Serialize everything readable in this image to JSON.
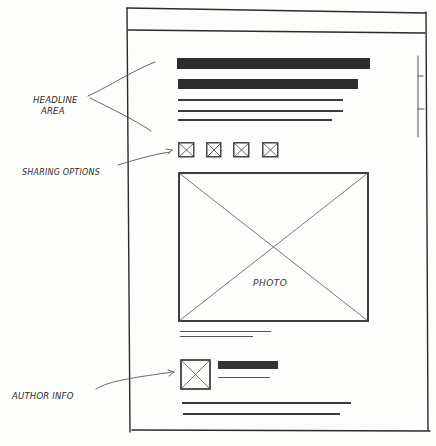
{
  "annotations": {
    "headline_area": [
      "HEADLINE",
      "AREA"
    ],
    "sharing_options": "SHARING OPTIONS",
    "author_info": "AUTHOR INFO"
  },
  "wireframe": {
    "browser_frame": {
      "has_top_bar": true,
      "has_scrollbar": true
    },
    "headline_bars": 2,
    "summary_lines": 3,
    "sharing_icons": [
      {
        "name": "share-icon-1"
      },
      {
        "name": "share-icon-2"
      },
      {
        "name": "share-icon-3"
      },
      {
        "name": "share-icon-4"
      }
    ],
    "photo": {
      "label": "PHOTO"
    },
    "caption_lines": 2,
    "author": {
      "avatar": "placeholder",
      "name_bar": true,
      "subline": true
    },
    "body_lines": 2
  },
  "colors": {
    "ink": "#2d2d2d",
    "paper": "#fdfdfb",
    "pencil": "#555555"
  }
}
